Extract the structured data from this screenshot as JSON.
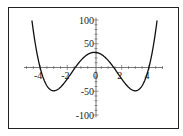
{
  "chart_data": {
    "type": "line",
    "title": "",
    "xlabel": "",
    "ylabel": "",
    "function": "f(x) = x^4 - 18x^2 + 32",
    "xlim": [
      -5.2,
      5.2
    ],
    "ylim": [
      -110,
      110
    ],
    "grid": false,
    "legend": null,
    "x_ticks": [
      -4,
      -2,
      0,
      2,
      4
    ],
    "x_tick_labels": [
      "-4",
      "-2",
      "0",
      "2",
      "4"
    ],
    "y_ticks": [
      100,
      50,
      -50,
      -100
    ],
    "y_tick_labels": [
      "100",
      "50",
      "-50",
      "-100"
    ],
    "series": [
      {
        "name": "f(x)",
        "color": "#111111",
        "x": [
          -4.6,
          -4.4,
          -4.2,
          -4.0,
          -3.8,
          -3.5,
          -3.0,
          -2.5,
          -2.0,
          -1.5,
          -1.0,
          -0.5,
          0,
          0.5,
          1.0,
          1.5,
          2.0,
          2.5,
          3.0,
          3.5,
          3.8,
          4.0,
          4.2,
          4.4,
          4.6
        ],
        "y": [
          99.0,
          58.3,
          25.7,
          0,
          -19.4,
          -42.4,
          -49,
          -33.4,
          -24,
          -3.4,
          15,
          27.6,
          32,
          27.6,
          15,
          -3.4,
          -24,
          -33.4,
          -49,
          -42.4,
          -19.4,
          0,
          25.7,
          58.3,
          99.0
        ]
      }
    ],
    "roots": [
      -4,
      -1.414,
      1.414,
      4
    ],
    "local_max": [
      0,
      32
    ],
    "local_min": [
      [
        -3,
        -49
      ],
      [
        3,
        -49
      ]
    ]
  },
  "frame_color": "#222222"
}
